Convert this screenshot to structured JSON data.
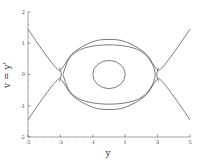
{
  "chart_data": {
    "type": "line",
    "title": "",
    "xlabel": "y",
    "ylabel": "v = y'",
    "xlim": [
      -5,
      5
    ],
    "ylim": [
      -2,
      2
    ],
    "xticks": [
      -5,
      -3,
      -1,
      1,
      3,
      5
    ],
    "yticks": [
      -2,
      -1,
      0,
      1,
      2
    ],
    "xtick_labels": [
      "-5",
      "-3",
      "-1",
      "1",
      "3",
      "5"
    ],
    "ytick_labels": [
      "-2",
      "-1",
      "0",
      "1",
      "2"
    ],
    "grid": false,
    "legend": null,
    "series": [
      {
        "name": "inner-closed-orbit",
        "kind": "ellipse",
        "center": [
          0,
          0
        ],
        "radius_x": 1.0,
        "radius_y": 0.45
      },
      {
        "name": "outer-closed-orbit",
        "kind": "closed-curve",
        "points": [
          [
            -2.85,
            0
          ],
          [
            -2.4,
            0.55
          ],
          [
            -1.5,
            0.85
          ],
          [
            0,
            0.95
          ],
          [
            1.5,
            0.85
          ],
          [
            2.4,
            0.55
          ],
          [
            2.85,
            0
          ],
          [
            2.4,
            -0.55
          ],
          [
            1.5,
            -0.85
          ],
          [
            0,
            -0.95
          ],
          [
            -1.5,
            -0.85
          ],
          [
            -2.4,
            -0.55
          ],
          [
            -2.85,
            0
          ]
        ]
      },
      {
        "name": "upper-separatrix",
        "kind": "open-curve",
        "points": [
          [
            -5,
            1.45
          ],
          [
            -4,
            0.7
          ],
          [
            -3.2,
            0.18
          ],
          [
            -2.9,
            0.2
          ],
          [
            -2.2,
            0.7
          ],
          [
            -1,
            1.05
          ],
          [
            0,
            1.12
          ],
          [
            1,
            1.05
          ],
          [
            2.2,
            0.7
          ],
          [
            2.9,
            0.2
          ],
          [
            3.2,
            0.18
          ],
          [
            4,
            0.7
          ],
          [
            5,
            1.45
          ]
        ]
      },
      {
        "name": "lower-separatrix",
        "kind": "open-curve",
        "points": [
          [
            -5,
            -1.45
          ],
          [
            -4,
            -0.7
          ],
          [
            -3.2,
            -0.18
          ],
          [
            -2.9,
            -0.2
          ],
          [
            -2.2,
            -0.7
          ],
          [
            -1,
            -1.05
          ],
          [
            0,
            -1.12
          ],
          [
            1,
            -1.05
          ],
          [
            2.2,
            -0.7
          ],
          [
            2.9,
            -0.2
          ],
          [
            3.2,
            -0.18
          ],
          [
            4,
            -0.7
          ],
          [
            5,
            -1.45
          ]
        ]
      },
      {
        "name": "left-saddle-inner-branch",
        "kind": "open-curve",
        "points": [
          [
            -3.05,
            0.22
          ],
          [
            -2.95,
            0
          ],
          [
            -3.05,
            -0.22
          ]
        ]
      },
      {
        "name": "right-saddle-inner-branch",
        "kind": "open-curve",
        "points": [
          [
            3.05,
            0.22
          ],
          [
            2.95,
            0
          ],
          [
            3.05,
            -0.22
          ]
        ]
      }
    ]
  },
  "axes": {
    "x_title": "y",
    "y_title": "v = y'"
  }
}
